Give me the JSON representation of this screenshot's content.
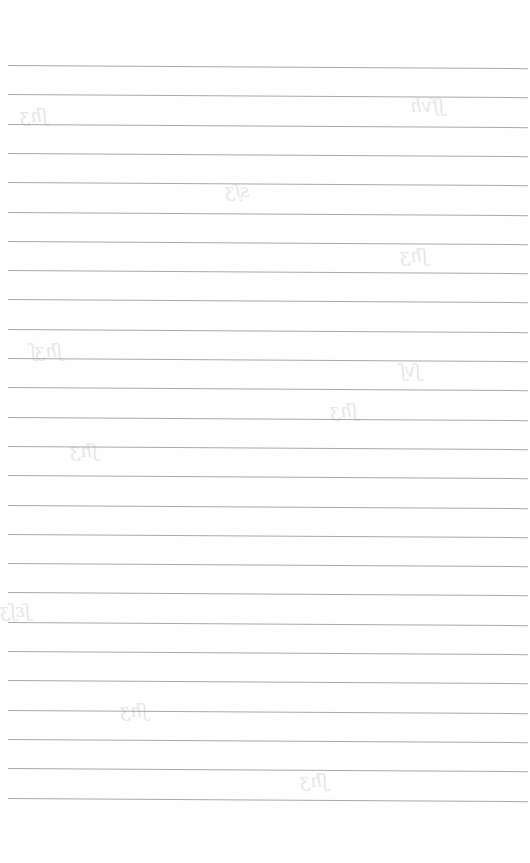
{
  "page": {
    "type": "lined-paper",
    "background_color": "#fefefe",
    "rule_color": "#9a9a9a",
    "rule_count": 26,
    "first_rule_y": 65,
    "rule_spacing": 29.3,
    "bleed_through": [
      {
        "x": 20,
        "y": 105,
        "text": "ʃhʒ"
      },
      {
        "x": 410,
        "y": 95,
        "text": "ʃfvh"
      },
      {
        "x": 225,
        "y": 180,
        "text": "sᶘʒ"
      },
      {
        "x": 400,
        "y": 245,
        "text": "ʃhʒ"
      },
      {
        "x": 30,
        "y": 340,
        "text": "ʃhʒʃ"
      },
      {
        "x": 400,
        "y": 360,
        "text": "ʃvʃ"
      },
      {
        "x": 70,
        "y": 440,
        "text": "ʃhʒ"
      },
      {
        "x": 330,
        "y": 400,
        "text": "ʃhʒ"
      },
      {
        "x": 0,
        "y": 600,
        "text": "ʃɛʃʒ"
      },
      {
        "x": 120,
        "y": 700,
        "text": "ʃhʒ"
      },
      {
        "x": 300,
        "y": 770,
        "text": "ʃhʒ"
      }
    ]
  }
}
